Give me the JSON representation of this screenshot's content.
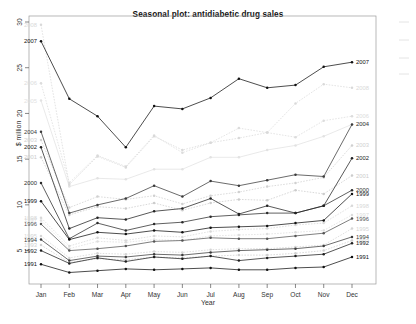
{
  "chart_data": {
    "type": "line",
    "title": "Seasonal plot: antidiabetic drug sales",
    "xlabel": "Year",
    "ylabel": "$ million",
    "categories": [
      "Jan",
      "Feb",
      "Mar",
      "Apr",
      "May",
      "Jun",
      "Jul",
      "Aug",
      "Sep",
      "Oct",
      "Nov",
      "Dec"
    ],
    "ylim": [
      2,
      30
    ],
    "yticks": [
      5,
      10,
      15,
      20,
      25,
      30
    ],
    "grid": false,
    "legend": "series-end-labels",
    "series": [
      {
        "name": "2008",
        "style": "dotted",
        "color": "#d9d9d9",
        "values": [
          29.7,
          12.2,
          15.3,
          14.1,
          17.5,
          16.0,
          16.8,
          17.3,
          17.9,
          21.1,
          23.2,
          22.8
        ]
      },
      {
        "name": "2007",
        "style": "solid",
        "color": "#111111",
        "values": [
          27.9,
          21.6,
          19.7,
          16.3,
          20.8,
          20.5,
          21.7,
          23.8,
          22.8,
          23.1,
          25.1,
          25.6
        ]
      },
      {
        "name": "2006",
        "style": "dotted",
        "color": "#dcdcdc",
        "values": [
          23.3,
          12.4,
          15.4,
          14.2,
          17.6,
          15.7,
          16.8,
          18.4,
          17.9,
          17.4,
          19.2,
          19.7
        ]
      },
      {
        "name": "2005",
        "style": "solid",
        "color": "#e2e2e2",
        "values": [
          21.4,
          12.0,
          12.9,
          12.8,
          13.9,
          13.9,
          15.2,
          15.2,
          16.0,
          16.5,
          17.5,
          18.8
        ]
      },
      {
        "name": "2004",
        "style": "solid",
        "color": "#3a3a3a",
        "values": [
          18.0,
          9.1,
          10.0,
          10.7,
          12.1,
          10.9,
          12.6,
          12.1,
          12.7,
          13.3,
          13.1,
          18.8
        ]
      },
      {
        "name": "2003",
        "style": "dotted",
        "color": "#d0d0d0",
        "values": [
          17.1,
          9.7,
          10.9,
          10.6,
          11.0,
          10.1,
          11.0,
          11.4,
          12.0,
          12.4,
          13.0,
          16.5
        ]
      },
      {
        "name": "2002",
        "style": "solid",
        "color": "#222222",
        "values": [
          16.3,
          7.4,
          8.6,
          8.4,
          9.3,
          9.6,
          10.7,
          9.0,
          9.9,
          9.1,
          9.9,
          15.1
        ]
      },
      {
        "name": "2001",
        "style": "dotted",
        "color": "#cccccc",
        "values": [
          15.2,
          8.9,
          9.8,
          9.6,
          10.2,
          9.4,
          10.2,
          10.6,
          10.5,
          11.6,
          11.2,
          13.2
        ]
      },
      {
        "name": "2000",
        "style": "solid",
        "color": "#2b2b2b",
        "values": [
          12.4,
          6.3,
          8.0,
          7.2,
          7.9,
          8.1,
          8.7,
          8.9,
          9.1,
          9.1,
          9.9,
          11.6
        ]
      },
      {
        "name": "1999",
        "style": "solid",
        "color": "#111111",
        "values": [
          10.4,
          6.2,
          7.0,
          6.8,
          7.2,
          7.0,
          7.5,
          7.6,
          7.7,
          8.0,
          8.3,
          11.2
        ]
      },
      {
        "name": "1998",
        "style": "dotted",
        "color": "#d8d8d8",
        "values": [
          8.6,
          5.5,
          6.4,
          6.1,
          6.6,
          6.5,
          7.1,
          7.3,
          7.4,
          7.8,
          8.0,
          9.9
        ]
      },
      {
        "name": "1997",
        "style": "dotted",
        "color": "#dddddd",
        "values": [
          8.3,
          5.2,
          6.0,
          5.9,
          6.2,
          6.1,
          6.6,
          6.7,
          6.8,
          7.0,
          7.2,
          8.9
        ]
      },
      {
        "name": "1996",
        "style": "solid",
        "color": "#555555",
        "values": [
          7.9,
          5.0,
          5.2,
          5.5,
          6.0,
          6.1,
          6.4,
          6.3,
          6.3,
          6.6,
          6.9,
          8.5
        ]
      },
      {
        "name": "1995",
        "style": "dotted",
        "color": "#d5d5d5",
        "values": [
          6.6,
          4.2,
          4.7,
          4.6,
          4.9,
          4.8,
          5.1,
          5.2,
          5.2,
          5.4,
          5.6,
          7.4
        ]
      },
      {
        "name": "1994",
        "style": "solid",
        "color": "#3c3c3c",
        "values": [
          6.2,
          3.9,
          4.4,
          4.3,
          4.6,
          4.5,
          4.8,
          5.0,
          5.1,
          5.2,
          5.5,
          6.5
        ]
      },
      {
        "name": "1993",
        "style": "dotted",
        "color": "#cfcfcf",
        "values": [
          5.6,
          3.7,
          4.1,
          4.0,
          4.3,
          4.2,
          4.4,
          4.5,
          4.5,
          4.7,
          5.0,
          6.1
        ]
      },
      {
        "name": "1992",
        "style": "solid",
        "color": "#1e1e1e",
        "values": [
          5.0,
          3.6,
          4.2,
          3.8,
          4.3,
          4.1,
          4.4,
          3.9,
          4.2,
          4.4,
          4.6,
          5.8
        ]
      },
      {
        "name": "1991",
        "style": "solid",
        "color": "#111111",
        "values": [
          3.5,
          2.6,
          2.8,
          3.0,
          2.9,
          3.0,
          3.1,
          2.9,
          2.9,
          3.1,
          3.2,
          4.3
        ]
      }
    ]
  },
  "axis": {
    "y_tick_labels": [
      "30",
      "25",
      "20",
      "15",
      "10",
      "5"
    ],
    "x_tick_labels": [
      "Jan",
      "Feb",
      "Mar",
      "Apr",
      "May",
      "Jun",
      "Jul",
      "Aug",
      "Sep",
      "Oct",
      "Nov",
      "Dec"
    ]
  }
}
